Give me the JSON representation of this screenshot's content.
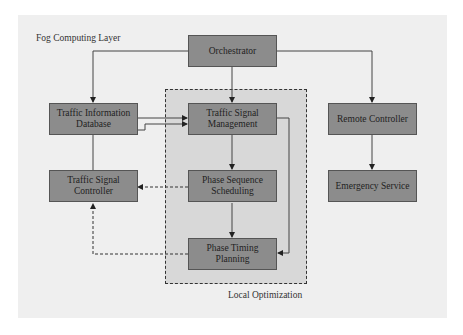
{
  "diagram": {
    "layer_label": "Fog Computing Layer",
    "group_label": "Local Optimization",
    "nodes": {
      "orchestrator": "Orchestrator",
      "traffic_info_db": "Traffic Information Database",
      "traffic_signal_mgmt": "Traffic Signal Management",
      "remote_controller": "Remote Controller",
      "traffic_signal_controller": "Traffic Signal Controller",
      "phase_sequence": "Phase Sequence Scheduling",
      "emergency_service": "Emergency Service",
      "phase_timing": "Phase Timing Planning"
    },
    "edges": [
      {
        "from": "Orchestrator",
        "to": "Traffic Information Database",
        "style": "solid"
      },
      {
        "from": "Orchestrator",
        "to": "Traffic Signal Management",
        "style": "solid"
      },
      {
        "from": "Orchestrator",
        "to": "Remote Controller",
        "style": "solid"
      },
      {
        "from": "Traffic Information Database",
        "to": "Traffic Signal Management",
        "style": "solid"
      },
      {
        "from": "Traffic Signal Controller",
        "to": "Traffic Signal Management",
        "style": "solid"
      },
      {
        "from": "Traffic Signal Management",
        "to": "Phase Sequence Scheduling",
        "style": "solid"
      },
      {
        "from": "Traffic Signal Management",
        "to": "Phase Timing Planning",
        "style": "solid"
      },
      {
        "from": "Phase Sequence Scheduling",
        "to": "Phase Timing Planning",
        "style": "solid"
      },
      {
        "from": "Phase Sequence Scheduling",
        "to": "Traffic Signal Controller",
        "style": "dashed"
      },
      {
        "from": "Phase Timing Planning",
        "to": "Traffic Signal Controller",
        "style": "dashed"
      },
      {
        "from": "Remote Controller",
        "to": "Emergency Service",
        "style": "solid"
      }
    ],
    "colors": {
      "background": "#efefef",
      "group_fill": "#d8d8d8",
      "node_fill": "#8c8c8c",
      "stroke": "#333333"
    }
  }
}
